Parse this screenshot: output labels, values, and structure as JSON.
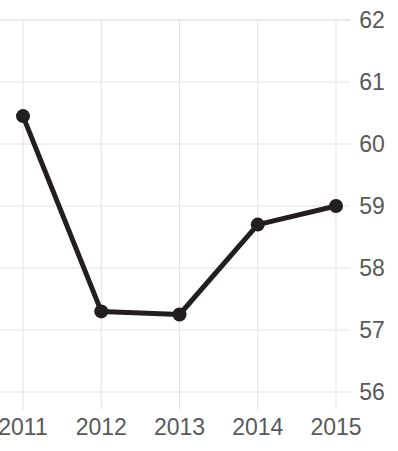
{
  "chart_data": {
    "type": "line",
    "title": "",
    "subtitle": "",
    "xlabel": "",
    "ylabel": "",
    "categories": [
      "2011",
      "2012",
      "2013",
      "2014",
      "2015"
    ],
    "x": [
      2011,
      2012,
      2013,
      2014,
      2015
    ],
    "values": [
      60.45,
      57.3,
      57.25,
      58.7,
      59.0
    ],
    "series": [
      {
        "name": "",
        "values": [
          60.45,
          57.3,
          57.25,
          58.7,
          59.0
        ]
      }
    ],
    "ylim": [
      56,
      62
    ],
    "y_ticks": [
      62,
      61,
      60,
      59,
      58,
      57,
      56
    ],
    "y_tick_labels": [
      "62",
      "61",
      "60",
      "59",
      "58",
      "57",
      "56"
    ],
    "x_tick_labels": [
      "2011",
      "2012",
      "2013",
      "2014",
      "2015"
    ],
    "grid": true,
    "grid_axis": "both",
    "legend": false,
    "legend_position": "none",
    "y_axis_position": "right",
    "annotations": [],
    "markers": "circle",
    "line_color": "#231f20",
    "marker_color": "#231f20",
    "grid_color": "#e3e3e6",
    "axis_label_color": "#58595b",
    "background_color": "#ffffff"
  },
  "figure": {
    "title_clipped": "",
    "line_width": 5,
    "marker_radius": 7
  }
}
